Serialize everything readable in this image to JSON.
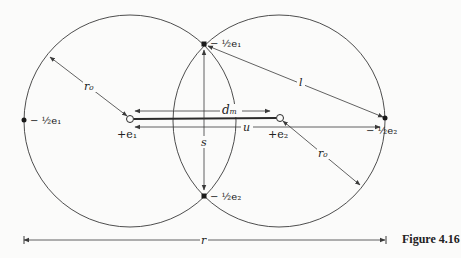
{
  "figure": {
    "caption": "Figure 4.16",
    "colors": {
      "line": "#3a3a3a",
      "text": "#222222",
      "background": "#fbfbfa"
    }
  },
  "labels": {
    "left_outer_charge": "− ½e₁",
    "top_charge": "− ½e₁",
    "bottom_charge": "− ½e₂",
    "right_outer_charge": "− ½e₂",
    "left_nucleus": "+e₁",
    "right_nucleus": "+e₂",
    "radius_left": "r₀",
    "radius_right": "r₀",
    "dm": "dₘ",
    "u": "u",
    "s": "s",
    "l": "l",
    "r": "r"
  },
  "geometry": {
    "left_circle": {
      "cx": 130,
      "cy": 121,
      "r": 106
    },
    "right_circle": {
      "cx": 279,
      "cy": 121,
      "r": 106
    },
    "top_intersection": {
      "x": 204,
      "y": 44
    },
    "bottom_intersection": {
      "x": 204,
      "y": 196
    }
  }
}
